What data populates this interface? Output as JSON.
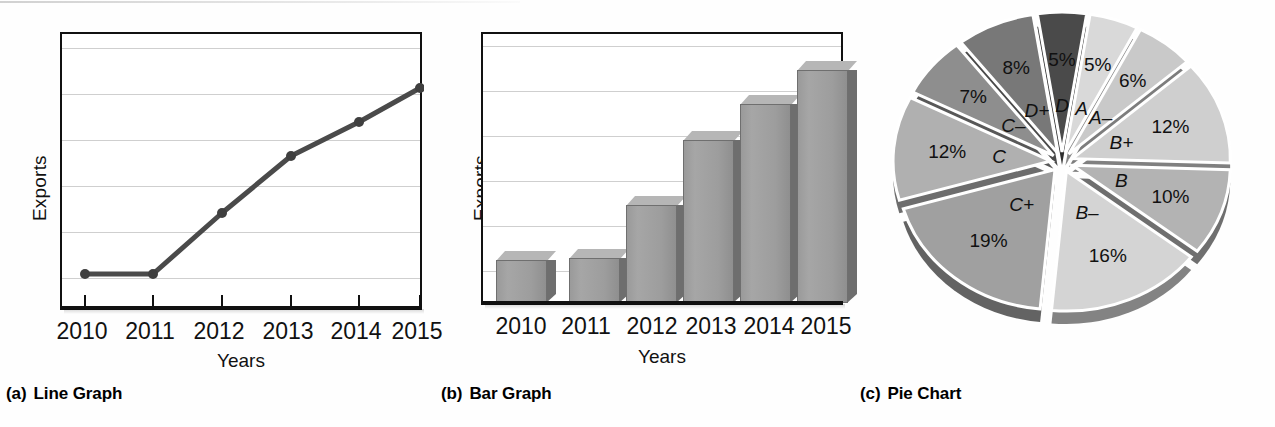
{
  "figure": {
    "panels": [
      {
        "index": "(a)",
        "title": "Line Graph"
      },
      {
        "index": "(b)",
        "title": "Bar Graph"
      },
      {
        "index": "(c)",
        "title": "Pie Chart"
      }
    ]
  },
  "chart_data": [
    {
      "type": "line",
      "title": "Line Graph",
      "xlabel": "Years",
      "ylabel": "Exports",
      "categories": [
        "2010",
        "2011",
        "2012",
        "2013",
        "2014",
        "2015"
      ],
      "values": [
        12,
        12,
        42,
        62,
        76,
        87
      ],
      "ylim": [
        0,
        100
      ],
      "yticks_labeled": false,
      "grid": true,
      "gridlines": 6,
      "legend": "none",
      "series_color": "#4a4a4a",
      "marker": "circle"
    },
    {
      "type": "bar",
      "title": "Bar Graph",
      "xlabel": "Years",
      "ylabel": "Exports",
      "categories": [
        "2010",
        "2011",
        "2012",
        "2013",
        "2014",
        "2015"
      ],
      "values": [
        15,
        16,
        35,
        59,
        72,
        86
      ],
      "ylim": [
        0,
        100
      ],
      "yticks_labeled": false,
      "grid": true,
      "gridlines": 6,
      "legend": "none",
      "bar_style": "3d",
      "bar_color": "#9e9e9e"
    },
    {
      "type": "pie",
      "title": "Pie Chart",
      "labels": [
        "D",
        "A",
        "A–",
        "B+",
        "B",
        "B–",
        "C+",
        "C",
        "C–",
        "D+"
      ],
      "values": [
        5,
        5,
        6,
        12,
        10,
        16,
        19,
        12,
        7,
        8
      ],
      "value_labels": [
        "5%",
        "5%",
        "6%",
        "12%",
        "10%",
        "16%",
        "19%",
        "12%",
        "7%",
        "8%"
      ],
      "colors": [
        "#4a4a4a",
        "#d9d9d9",
        "#c9c9c9",
        "#cfcfcf",
        "#b3b3b3",
        "#d4d4d4",
        "#a0a0a0",
        "#b0b0b0",
        "#8e8e8e",
        "#787878"
      ],
      "exploded": true,
      "legend": "none",
      "start_angle_deg": -9
    }
  ],
  "line_chart": {
    "ylabel": "Exports",
    "xlabel": "Years",
    "xticks": [
      "2010",
      "2011",
      "2012",
      "2013",
      "2014",
      "2015"
    ]
  },
  "bar_chart": {
    "ylabel": "Exports",
    "xlabel": "Years",
    "xticks": [
      "2010",
      "2011",
      "2012",
      "2013",
      "2014",
      "2015"
    ]
  },
  "pie_chart": {
    "slices": [
      {
        "label": "D",
        "percent": "5%"
      },
      {
        "label": "A",
        "percent": "5%"
      },
      {
        "label": "A–",
        "percent": "6%"
      },
      {
        "label": "B+",
        "percent": "12%"
      },
      {
        "label": "B",
        "percent": "10%"
      },
      {
        "label": "B–",
        "percent": "16%"
      },
      {
        "label": "C+",
        "percent": "19%"
      },
      {
        "label": "C",
        "percent": "12%"
      },
      {
        "label": "C–",
        "percent": "7%"
      },
      {
        "label": "D+",
        "percent": "8%"
      }
    ]
  }
}
